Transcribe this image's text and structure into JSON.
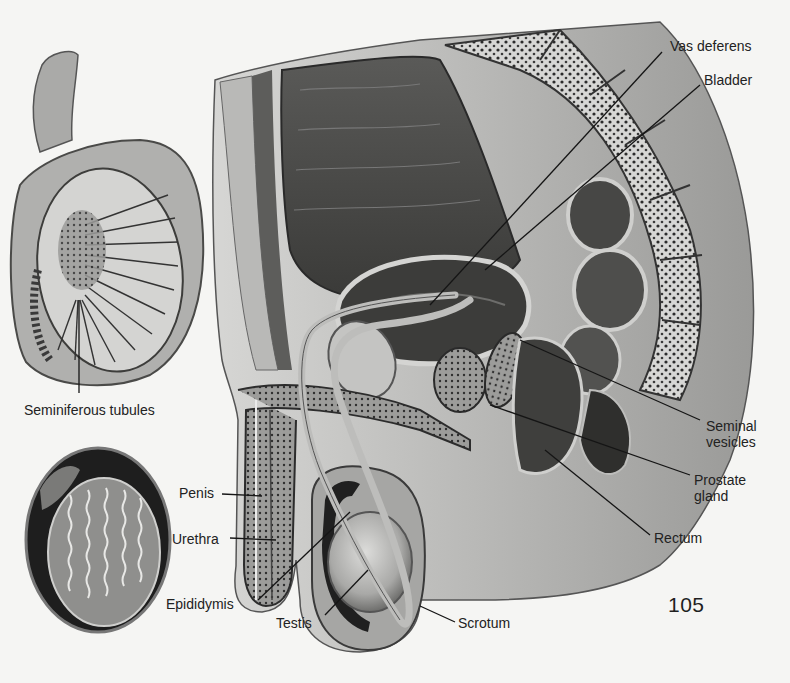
{
  "figure": {
    "page_number": "105",
    "main_view": "sagittal-section-male-pelvis",
    "inset_top": "testis-cross-section",
    "inset_bottom": "testis-tubules-detail"
  },
  "labels": {
    "vas_deferens": "Vas deferens",
    "bladder": "Bladder",
    "seminal_vesicles": [
      "Seminal",
      "vesicles"
    ],
    "prostate_gland": [
      "Prostate",
      "gland"
    ],
    "rectum": "Rectum",
    "scrotum": "Scrotum",
    "testis": "Testis",
    "epididymis": "Epididymis",
    "urethra": "Urethra",
    "penis": "Penis",
    "seminiferous_tubules": "Seminiferous tubules"
  },
  "colors": {
    "paper": "#f5f5f3",
    "ink": "#1e1e1e",
    "tissue_light": "#c9c9c7",
    "tissue_mid": "#8d8d8b",
    "tissue_dark": "#3a3a3a"
  }
}
